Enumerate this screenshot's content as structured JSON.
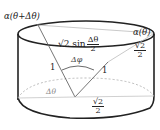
{
  "diagram": {
    "type": "cylinder-geometry",
    "labels": {
      "top_left_point": "α(θ+Δθ)",
      "top_right_point": "α(θ)",
      "chord_prefix": "√2 sin",
      "chord_frac_num": "Δθ",
      "chord_frac_den": "2",
      "left_edge": "1",
      "right_edge": "1",
      "apex_angle": "Δφ",
      "base_angle": "Δθ",
      "height_num": "√2",
      "height_den": "2",
      "radius_num": "√2",
      "radius_den": "2"
    },
    "colors": {
      "stroke": "#222222",
      "light_stroke": "#999999",
      "text": "#222222"
    }
  }
}
